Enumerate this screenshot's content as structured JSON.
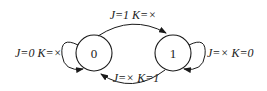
{
  "diagram": {
    "type": "state-diagram",
    "states": [
      {
        "id": "s0",
        "label": "0"
      },
      {
        "id": "s1",
        "label": "1"
      }
    ],
    "transitions": [
      {
        "from": "0",
        "to": "1",
        "label": "J=1 K=×"
      },
      {
        "from": "1",
        "to": "0",
        "label": "J=× K=1"
      },
      {
        "from": "0",
        "to": "0",
        "label": "J=0 K=×"
      },
      {
        "from": "1",
        "to": "1",
        "label": "J=× K=0"
      }
    ],
    "colors": {
      "line": "#1a1a1a",
      "background": "#ffffff"
    }
  }
}
